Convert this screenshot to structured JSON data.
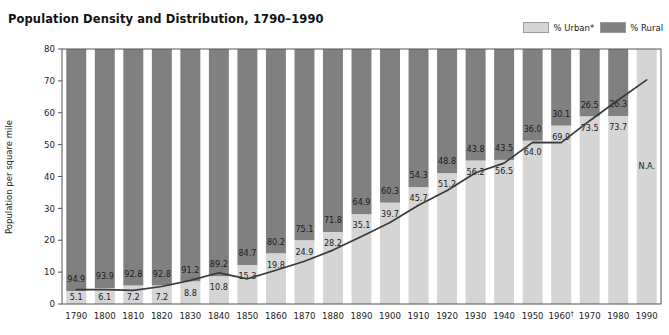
{
  "header": {
    "title": "Population Density and Distribution, 1790–1990"
  },
  "legend": {
    "items": [
      {
        "label": "% Urban*",
        "color": "#d5d5d5",
        "name": "urban"
      },
      {
        "label": "% Rural",
        "color": "#808080",
        "name": "rural"
      }
    ]
  },
  "axes": {
    "ylabel": "Population per square mile",
    "yticks": [
      "0",
      "10",
      "20",
      "30",
      "40",
      "50",
      "60",
      "70",
      "80"
    ],
    "xticks": [
      "1790",
      "1800",
      "1810",
      "1820",
      "1830",
      "1840",
      "1850",
      "1860",
      "1870",
      "1880",
      "1890",
      "1900",
      "1910",
      "1920",
      "1930",
      "1940",
      "1950",
      "1960†",
      "1970",
      "1980",
      "1990"
    ]
  },
  "chart_data": {
    "type": "bar",
    "title": "Population Density and Distribution, 1790–1990",
    "xlabel": "",
    "ylabel": "Population per square mile",
    "ylim": [
      0,
      80
    ],
    "grid": false,
    "legend_position": "top-right",
    "categories": [
      "1790",
      "1800",
      "1810",
      "1820",
      "1830",
      "1840",
      "1850",
      "1860",
      "1870",
      "1880",
      "1890",
      "1900",
      "1910",
      "1920",
      "1930",
      "1940",
      "1950",
      "1960",
      "1970",
      "1980",
      "1990"
    ],
    "series": [
      {
        "name": "% Urban*",
        "type": "bar-stacked",
        "color": "#d5d5d5",
        "values": [
          5.1,
          6.1,
          7.2,
          7.2,
          8.8,
          10.8,
          15.3,
          19.8,
          24.9,
          28.2,
          35.1,
          39.7,
          45.7,
          51.2,
          56.2,
          56.5,
          64.0,
          69.9,
          73.5,
          73.7,
          null
        ],
        "labels": [
          "5.1",
          "6.1",
          "7.2",
          "7.2",
          "8.8",
          "10.8",
          "15.3",
          "19.8",
          "24.9",
          "28.2",
          "35.1",
          "39.7",
          "45.7",
          "51.2",
          "56.2",
          "56.5",
          "64.0",
          "69.9",
          "73.5",
          "73.7",
          "N.A."
        ]
      },
      {
        "name": "% Rural",
        "type": "bar-stacked",
        "color": "#808080",
        "values": [
          94.9,
          93.9,
          92.8,
          92.8,
          91.2,
          89.2,
          84.7,
          80.2,
          75.1,
          71.8,
          64.9,
          60.3,
          54.3,
          48.8,
          43.8,
          43.5,
          36.0,
          30.1,
          26.5,
          26.3,
          null
        ],
        "labels": [
          "94.9",
          "93.9",
          "92.8",
          "92.8",
          "91.2",
          "89.2",
          "84.7",
          "80.2",
          "75.1",
          "71.8",
          "64.9",
          "60.3",
          "54.3",
          "48.8",
          "43.8",
          "43.5",
          "36.0",
          "30.1",
          "26.5",
          "26.3",
          ""
        ]
      },
      {
        "name": "Population per square mile",
        "type": "line",
        "color": "#3a3a3a",
        "values": [
          4.5,
          4.5,
          4.3,
          5.5,
          7.4,
          9.8,
          7.9,
          10.6,
          13.4,
          16.9,
          21.2,
          25.6,
          31.0,
          35.6,
          41.2,
          44.2,
          50.7,
          50.6,
          57.5,
          64.0,
          70.3
        ]
      }
    ],
    "annotations": [
      {
        "text": "N.A.",
        "category": "1990",
        "note": "1990 urban/rural split not available"
      }
    ]
  }
}
